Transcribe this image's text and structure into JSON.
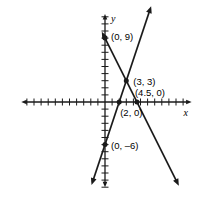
{
  "figure": {
    "title": "",
    "background_color": "#ffffff",
    "line_color": "#1a1a1a",
    "width": 203,
    "height": 208
  },
  "axes": {
    "x_label": "x",
    "y_label": "y",
    "origin_px": {
      "x": 105,
      "y": 102
    },
    "unit_px": 7.1,
    "x_range": [
      -11.8,
      12.2
    ],
    "y_range": [
      -12.0,
      12.4
    ],
    "x_tick_count_left": 11,
    "x_tick_count_right": 11,
    "y_tick_count_up": 12,
    "y_tick_count_down": 12,
    "tick_length_px": 7,
    "grid": false,
    "arrows": [
      "left",
      "right",
      "up",
      "down"
    ]
  },
  "chart_data": {
    "type": "line",
    "title": "",
    "xlabel": "x",
    "ylabel": "y",
    "xlim": [
      -11.8,
      12.2
    ],
    "ylim": [
      -12.0,
      12.4
    ],
    "grid": false,
    "legend": "none",
    "series": [
      {
        "name": "line-falling",
        "description": "Line through (0, 9) and (4.5, 0), negative slope",
        "slope": -2,
        "intercept": 9,
        "equation": "y = -2x + 9",
        "x": [
          0,
          3,
          4.5
        ],
        "y": [
          9,
          3,
          0
        ],
        "endpoints": [
          {
            "x": -0.45,
            "y": 9.9
          },
          {
            "x": 10.4,
            "y": -11.8
          }
        ],
        "arrow_start": true,
        "arrow_end": true
      },
      {
        "name": "line-rising",
        "description": "Line through (0, -6) and (2, 0), positive slope",
        "slope": 3,
        "intercept": -6,
        "equation": "y = 3x - 6",
        "x": [
          0,
          2,
          3
        ],
        "y": [
          -6,
          0,
          3
        ],
        "endpoints": [
          {
            "x": -1.9,
            "y": -11.7
          },
          {
            "x": 6.5,
            "y": 13.5
          }
        ],
        "arrow_start": true,
        "arrow_end": true
      }
    ],
    "points": [
      {
        "id": "p-0-9",
        "label": "(0, 9)",
        "x": 0,
        "y": 9,
        "label_dx_px": 6,
        "label_dy_px": 2,
        "marker": "filled-circle"
      },
      {
        "id": "p-3-3",
        "label": "(3, 3)",
        "x": 3,
        "y": 3,
        "label_dx_px": 7,
        "label_dy_px": 4,
        "marker": "filled-circle"
      },
      {
        "id": "p-45-0",
        "label": "(4.5, 0)",
        "x": 4.5,
        "y": 0,
        "label_dx_px": -2,
        "label_dy_px": -6,
        "marker": "filled-circle"
      },
      {
        "id": "p-2-0",
        "label": "(2, 0)",
        "x": 2,
        "y": 0,
        "label_dx_px": 1,
        "label_dy_px": 14,
        "marker": "filled-circle"
      },
      {
        "id": "p-0-m6",
        "label": "(0, –6)",
        "x": 0,
        "y": -6,
        "label_dx_px": 6,
        "label_dy_px": 4,
        "marker": "filled-circle"
      }
    ],
    "intersection": {
      "label": "(3, 3)",
      "x": 3,
      "y": 3
    }
  }
}
